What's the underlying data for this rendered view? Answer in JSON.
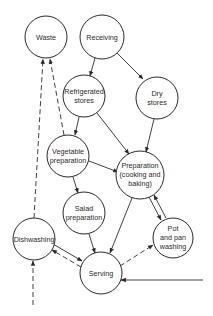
{
  "diagram": {
    "type": "flow",
    "nodes": [
      {
        "id": "waste",
        "lines": [
          "Waste"
        ]
      },
      {
        "id": "receiving",
        "lines": [
          "Receiving"
        ]
      },
      {
        "id": "refrigerated",
        "lines": [
          "Refrigerated",
          "stores"
        ]
      },
      {
        "id": "dry",
        "lines": [
          "Dry",
          "stores"
        ]
      },
      {
        "id": "vegetable",
        "lines": [
          "Vegetable",
          "preparation"
        ]
      },
      {
        "id": "preparation",
        "lines": [
          "Preparation",
          "(cooking and",
          "baking)"
        ]
      },
      {
        "id": "salad",
        "lines": [
          "Salad",
          "preparation"
        ]
      },
      {
        "id": "pot",
        "lines": [
          "Pot",
          "and pan",
          "washing"
        ]
      },
      {
        "id": "dishwashing",
        "lines": [
          "Dishwashing"
        ]
      },
      {
        "id": "serving",
        "lines": [
          "Serving"
        ]
      }
    ],
    "edges": [
      {
        "from": "receiving",
        "to": "refrigerated",
        "style": "solid"
      },
      {
        "from": "receiving",
        "to": "dry",
        "style": "solid"
      },
      {
        "from": "refrigerated",
        "to": "vegetable",
        "style": "solid"
      },
      {
        "from": "refrigerated",
        "to": "preparation",
        "style": "solid"
      },
      {
        "from": "dry",
        "to": "preparation",
        "style": "solid"
      },
      {
        "from": "vegetable",
        "to": "preparation",
        "style": "solid"
      },
      {
        "from": "vegetable",
        "to": "salad",
        "style": "solid"
      },
      {
        "from": "vegetable",
        "to": "waste",
        "style": "dashed"
      },
      {
        "from": "dishwashing",
        "to": "waste",
        "style": "dashed"
      },
      {
        "from": "preparation",
        "to": "serving",
        "style": "solid"
      },
      {
        "from": "preparation",
        "to": "pot",
        "style": "solid"
      },
      {
        "from": "pot",
        "to": "preparation",
        "style": "solid"
      },
      {
        "from": "salad",
        "to": "serving",
        "style": "solid"
      },
      {
        "from": "serving",
        "to": "pot",
        "style": "dashed"
      },
      {
        "from": "serving",
        "to": "dishwashing",
        "style": "dashed"
      },
      {
        "from": "dishwashing",
        "to": "serving",
        "style": "solid"
      },
      {
        "from": "external-bottom",
        "to": "dishwashing",
        "style": "dashed"
      },
      {
        "from": "external-right",
        "to": "serving",
        "style": "solid"
      }
    ]
  }
}
